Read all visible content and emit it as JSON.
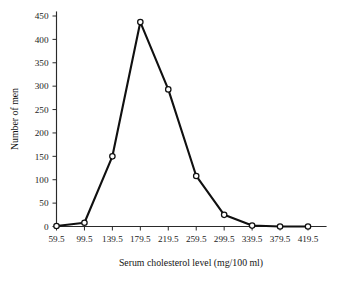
{
  "chart_data": {
    "type": "line",
    "title": "",
    "xlabel": "Serum cholesterol level (mg/100 ml)",
    "ylabel": "Number of men",
    "x": [
      59.5,
      99.5,
      139.5,
      179.5,
      219.5,
      259.5,
      299.5,
      339.5,
      379.5,
      419.5
    ],
    "xticklabels": [
      "59.5",
      "99.5",
      "139.5",
      "179.5",
      "219.5",
      "259.5",
      "299.5",
      "339.5",
      "379.5",
      "419.5"
    ],
    "values": [
      1,
      8,
      150,
      437,
      293,
      108,
      25,
      2,
      0,
      0
    ],
    "yticks": [
      0,
      50,
      100,
      150,
      200,
      250,
      300,
      350,
      400,
      450
    ],
    "yticklabels": [
      "0",
      "50",
      "100",
      "150",
      "200",
      "250",
      "300",
      "350",
      "400",
      "450"
    ],
    "ylim": [
      0,
      450
    ],
    "xlim": [
      59.5,
      419.5
    ],
    "grid": false,
    "legend": false,
    "marker": "open-circle",
    "line_color": "#101010",
    "marker_fill": "#ffffff",
    "background": "#ffffff"
  },
  "axes": {
    "y_title": "Number of men",
    "x_title": "Serum cholesterol level (mg/100 ml)"
  }
}
